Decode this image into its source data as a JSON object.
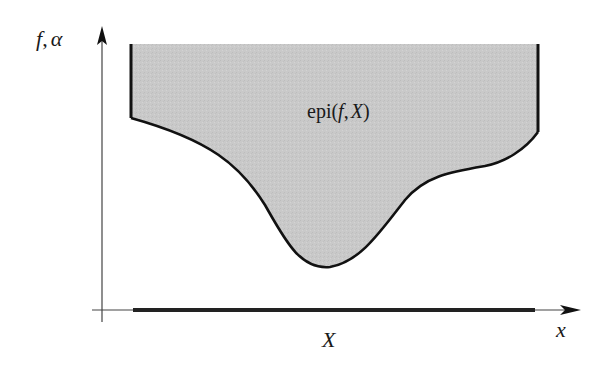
{
  "diagram": {
    "y_axis_label": {
      "f": "f",
      "sep": ",",
      "alpha": "α"
    },
    "x_axis_label": "x",
    "domain_label": "X",
    "region_label": {
      "prefix": "epi(",
      "f": "f",
      "sep": ",",
      "X": "X",
      "suffix": ")"
    },
    "colors": {
      "fill": "#c8c8c8",
      "stroke": "#111111",
      "axis": "#333333"
    }
  }
}
